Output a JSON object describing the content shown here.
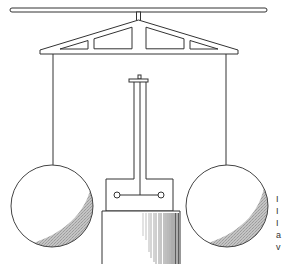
{
  "figure": {
    "colors": {
      "line": "#333333",
      "shade": "#b5b5b5",
      "background": "#ffffff"
    },
    "components": [
      "top-beam",
      "suspension-stem",
      "truss-frame",
      "left-suspension-string",
      "right-suspension-string",
      "left-sphere",
      "right-sphere",
      "central-column",
      "column-cap",
      "pivot-box",
      "left-pivot-ring",
      "right-pivot-ring",
      "base-block"
    ]
  },
  "caption_fragments": [
    "I",
    "I",
    "I",
    "a",
    "v"
  ]
}
